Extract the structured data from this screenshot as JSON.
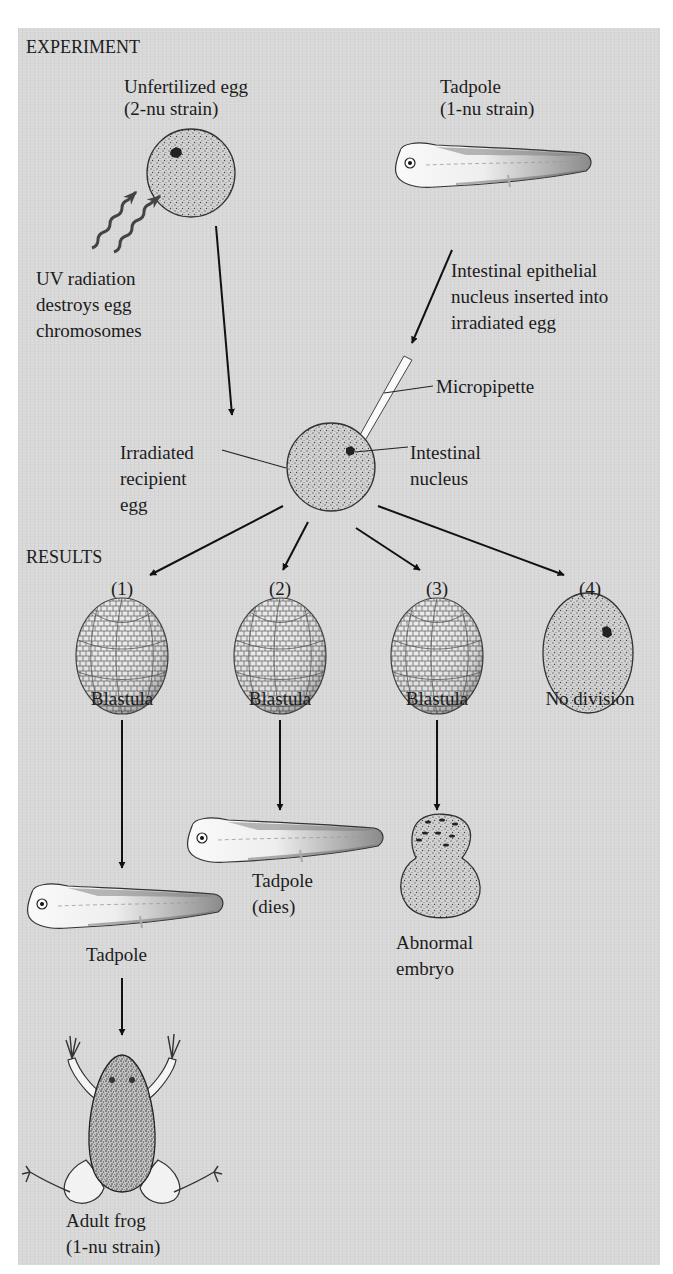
{
  "figure": {
    "sections": {
      "experiment": "EXPERIMENT",
      "results": "RESULTS"
    },
    "experiment": {
      "donor_egg": {
        "line1": "Unfertilized egg",
        "line2": "(2-nu strain)"
      },
      "donor_tadpole": {
        "line1": "Tadpole",
        "line2": "(1-nu strain)"
      },
      "uv_note": {
        "line1": "UV radiation",
        "line2": "destroys egg",
        "line3": "chromosomes"
      },
      "transfer_note": {
        "line1": "Intestinal epithelial",
        "line2": "nucleus inserted into",
        "line3": "irradiated egg"
      },
      "micropipette": "Micropipette",
      "recipient_egg": {
        "line1": "Irradiated",
        "line2": "recipient",
        "line3": "egg"
      },
      "intestinal_nucleus": {
        "line1": "Intestinal",
        "line2": "nucleus"
      }
    },
    "results": [
      {
        "number": "(1)",
        "stage": "Blastula",
        "next": "Tadpole",
        "final": {
          "line1": "Adult frog",
          "line2": "(1-nu strain)"
        }
      },
      {
        "number": "(2)",
        "stage": "Blastula",
        "next": {
          "line1": "Tadpole",
          "line2": "(dies)"
        }
      },
      {
        "number": "(3)",
        "stage": "Blastula",
        "next": {
          "line1": "Abnormal",
          "line2": "embryo"
        }
      },
      {
        "number": "(4)",
        "stage": "No division"
      }
    ],
    "icons": [
      "unfertilized-egg-icon",
      "tadpole-icon",
      "uv-radiation-icon",
      "micropipette-icon",
      "recipient-egg-icon",
      "blastula-icon",
      "undivided-egg-icon",
      "abnormal-embryo-icon",
      "adult-frog-icon"
    ],
    "colors": {
      "panel": "#d8d8d8",
      "ink": "#1a1a1a",
      "egg_fill": "#c9c9c9",
      "page": "#ffffff"
    }
  }
}
